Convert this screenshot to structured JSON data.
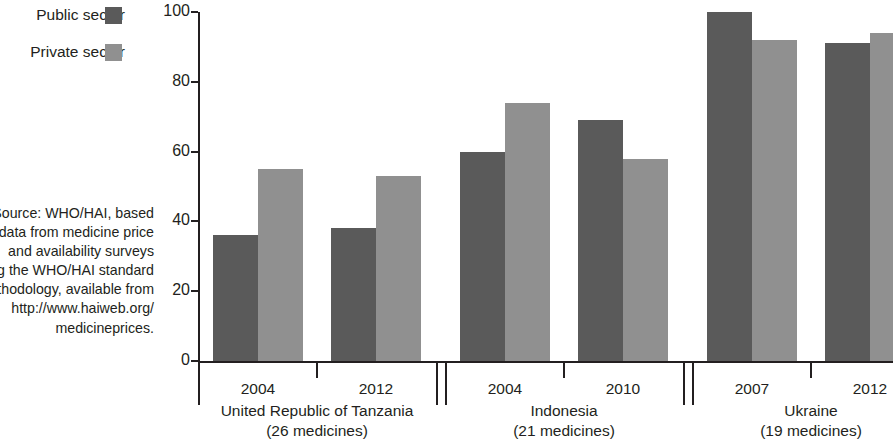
{
  "legend": {
    "items": [
      {
        "label": "Public sector",
        "color": "#5a5a5a",
        "key": "public"
      },
      {
        "label": "Private sector",
        "color": "#909090",
        "key": "private"
      }
    ]
  },
  "source_note": {
    "lines": [
      "Source: WHO/HAI, based",
      "on data from medicine price",
      "and availability surveys",
      "using the WHO/HAI standard",
      "methodology, available from",
      "http://www.haiweb.org/",
      "medicineprices."
    ]
  },
  "chart_data": {
    "type": "bar",
    "title": "",
    "xlabel": "",
    "ylabel": "",
    "ylim": [
      0,
      100
    ],
    "yticks": [
      0,
      20,
      40,
      60,
      80,
      100
    ],
    "grid": false,
    "legend_position": "top-left",
    "categories": [
      "United Republic of Tanzania 2004",
      "United Republic of Tanzania 2012",
      "Indonesia 2004",
      "Indonesia 2010",
      "Ukraine 2007",
      "Ukraine 2012"
    ],
    "series": [
      {
        "name": "Public sector",
        "color": "#5a5a5a",
        "values": [
          36,
          38,
          60,
          69,
          100,
          91
        ]
      },
      {
        "name": "Private sector",
        "color": "#909090",
        "values": [
          55,
          53,
          74,
          58,
          92,
          94
        ]
      }
    ],
    "groups": [
      {
        "name": "United Republic of Tanzania",
        "sublabel": "(26 medicines)",
        "years": [
          "2004",
          "2012"
        ],
        "public": [
          36,
          38
        ],
        "private": [
          55,
          53
        ]
      },
      {
        "name": "Indonesia",
        "sublabel": "(21 medicines)",
        "years": [
          "2004",
          "2010"
        ],
        "public": [
          60,
          69
        ],
        "private": [
          74,
          58
        ]
      },
      {
        "name": "Ukraine",
        "sublabel": "(19 medicines)",
        "years": [
          "2007",
          "2012"
        ],
        "public": [
          100,
          91
        ],
        "private": [
          92,
          94
        ]
      }
    ]
  }
}
